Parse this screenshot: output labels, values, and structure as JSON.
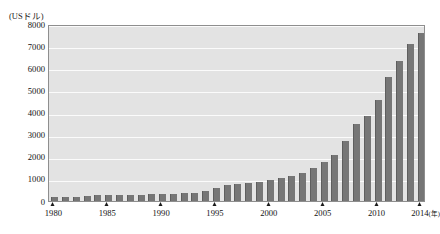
{
  "chart_data": {
    "type": "bar",
    "title": "",
    "subtitle": "",
    "xlabel": "(年)",
    "ylabel": "(USドル)",
    "ylim": [
      0,
      8000
    ],
    "ytick_interval": 1000,
    "yticks": [
      "8000",
      "7000",
      "6000",
      "5000",
      "4000",
      "3000",
      "2000",
      "1000",
      "0"
    ],
    "ytick_values": [
      8000,
      7000,
      6000,
      5000,
      4000,
      3000,
      2000,
      1000,
      0
    ],
    "xticks_labeled": [
      "1980",
      "1985",
      "1990",
      "1995",
      "2000",
      "2005",
      "2010",
      "2014"
    ],
    "grid": true,
    "grid_axis": "y",
    "legend": "none",
    "bar_color": "#767676",
    "plot_background": "#e3e3e3",
    "gridline_color": "#fbfbfb",
    "frame_color": "#8e8e8e",
    "categories": [
      "1980",
      "1981",
      "1982",
      "1983",
      "1984",
      "1985",
      "1986",
      "1987",
      "1988",
      "1989",
      "1990",
      "1991",
      "1992",
      "1993",
      "1994",
      "1995",
      "1996",
      "1997",
      "1998",
      "1999",
      "2000",
      "2001",
      "2002",
      "2003",
      "2004",
      "2005",
      "2006",
      "2007",
      "2008",
      "2009",
      "2010",
      "2011",
      "2012",
      "2013",
      "2014"
    ],
    "values": [
      195,
      197,
      203,
      225,
      250,
      294,
      282,
      252,
      284,
      311,
      317,
      333,
      366,
      377,
      473,
      609,
      709,
      781,
      828,
      873,
      959,
      1053,
      1149,
      1288,
      1509,
      1753,
      2099,
      2695,
      3471,
      3838,
      4550,
      5618,
      6317,
      7081,
      7590
    ]
  },
  "axis": {
    "y_unit_caption": "(USドル)",
    "x_unit_caption": "(年)"
  }
}
